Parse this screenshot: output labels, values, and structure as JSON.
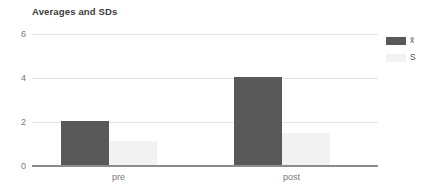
{
  "chart_data": {
    "type": "bar",
    "title": "Averages and SDs",
    "xlabel": "",
    "ylabel": "",
    "categories": [
      "pre",
      "post"
    ],
    "series": [
      {
        "name": "x̄",
        "color": "#595959",
        "values": [
          2.05,
          4.05
        ]
      },
      {
        "name": "S",
        "color": "#f2f2f2",
        "values": [
          1.15,
          1.5
        ]
      }
    ],
    "ylim": [
      0,
      6
    ],
    "yticks": [
      0,
      2,
      4,
      6
    ],
    "ytick_labels": [
      "0",
      "2",
      "4",
      "6"
    ],
    "grid": true,
    "legend_position": "right"
  },
  "legend": {
    "items": [
      {
        "label": "x̄",
        "color": "#595959"
      },
      {
        "label": "S",
        "color": "#f2f2f2"
      }
    ]
  },
  "colors": {
    "mean_bar": "#595959",
    "sd_bar": "#f2f2f2",
    "gridline": "#e4e4e4",
    "axis": "#8c8c8c",
    "title_text": "#3c3c3c",
    "tick_text": "#777777",
    "background": "#ffffff"
  }
}
